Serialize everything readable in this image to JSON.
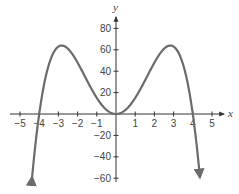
{
  "chart_data": {
    "type": "line",
    "title": "",
    "xlabel": "x",
    "ylabel": "y",
    "function": "y = -x^4 + 16x^2",
    "xlim": [
      -5.5,
      5.5
    ],
    "ylim": [
      -60,
      80
    ],
    "x_ticks": [
      -5,
      -4,
      -3,
      -2,
      -1,
      1,
      2,
      3,
      4,
      5
    ],
    "x_tick_labels": [
      "−5",
      "−4",
      "−3",
      "−2",
      "−1",
      "1",
      "2",
      "3",
      "4",
      "5"
    ],
    "y_ticks": [
      -60,
      -40,
      -20,
      20,
      40,
      60,
      80
    ],
    "y_tick_labels": [
      "−60",
      "−40",
      "−20",
      "20",
      "40",
      "60",
      "80"
    ],
    "grid": false,
    "series": [
      {
        "name": "f(x)",
        "color": "#6b6b6b",
        "key_points": [
          {
            "x": -4.37,
            "y": -60
          },
          {
            "x": -4,
            "y": 0
          },
          {
            "x": -2.83,
            "y": 64
          },
          {
            "x": 0,
            "y": 0
          },
          {
            "x": 2.83,
            "y": 64
          },
          {
            "x": 4,
            "y": 0
          },
          {
            "x": 4.37,
            "y": -60
          }
        ],
        "end_behavior": "arrows pointing down on both ends"
      }
    ]
  },
  "axes": {
    "x_label": "x",
    "y_label": "y",
    "axis_color": "#333333",
    "curve_color": "#6b6b6b"
  }
}
